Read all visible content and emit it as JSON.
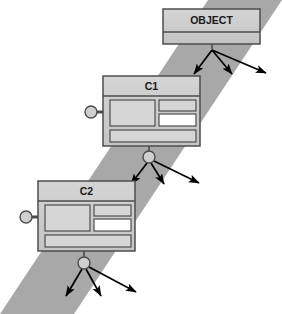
{
  "diagram": {
    "type": "class-hierarchy-diagram",
    "canvas": {
      "width": 282,
      "height": 314,
      "background": "#ffffff"
    },
    "colors": {
      "band": "#a8a8a8",
      "box_fill": "#cfcfcf",
      "box_header_fill": "#c8c8c8",
      "compartment_fill": "#d6d6d6",
      "compartment_highlight_fill": "#ffffff",
      "stroke": "#4d4d4d",
      "arrow": "#000000",
      "text": "#1a1a1a"
    },
    "band": {
      "name": "diagonal-band",
      "points": "208,0 282,0 74,314 0,314",
      "fill": "#a8a8a8"
    },
    "classes": [
      {
        "id": "object",
        "label": "OBJECT",
        "x": 163,
        "y": 9,
        "width": 97,
        "height": 35,
        "header_height": 23,
        "font_size": 10.5,
        "has_lollipop": false,
        "compartments": []
      },
      {
        "id": "c1",
        "label": "C1",
        "x": 103,
        "y": 76,
        "width": 97,
        "height": 70,
        "header_height": 20,
        "font_size": 10.5,
        "has_lollipop": true,
        "lollipop": {
          "cx": 91,
          "cy": 112,
          "r": 6,
          "line_to_x": 107
        },
        "compartments": [
          {
            "name": "left-large",
            "x": 110,
            "y": 100,
            "w": 45,
            "h": 26,
            "fill": "#d6d6d6"
          },
          {
            "name": "right-upper",
            "x": 159,
            "y": 100,
            "w": 37,
            "h": 11,
            "fill": "#d6d6d6"
          },
          {
            "name": "right-lower-highlight",
            "x": 159,
            "y": 114,
            "w": 37,
            "h": 12,
            "fill": "#ffffff"
          },
          {
            "name": "bottom-wide",
            "x": 110,
            "y": 130,
            "w": 86,
            "h": 12,
            "fill": "#d6d6d6"
          }
        ]
      },
      {
        "id": "c2",
        "label": "C2",
        "x": 38,
        "y": 181,
        "width": 97,
        "height": 70,
        "header_height": 20,
        "font_size": 10.5,
        "has_lollipop": true,
        "lollipop": {
          "cx": 26,
          "cy": 217,
          "r": 6,
          "line_to_x": 42
        },
        "compartments": [
          {
            "name": "left-large",
            "x": 45,
            "y": 205,
            "w": 45,
            "h": 26,
            "fill": "#d6d6d6"
          },
          {
            "name": "right-upper",
            "x": 94,
            "y": 205,
            "w": 37,
            "h": 11,
            "fill": "#d6d6d6"
          },
          {
            "name": "right-lower-highlight",
            "x": 94,
            "y": 219,
            "w": 37,
            "h": 12,
            "fill": "#ffffff"
          },
          {
            "name": "bottom-wide",
            "x": 45,
            "y": 235,
            "w": 86,
            "h": 12,
            "fill": "#d6d6d6"
          }
        ]
      }
    ],
    "junctions": [
      {
        "id": "junction-object",
        "from_class": "object",
        "stem": {
          "x1": 212,
          "y1": 44,
          "x2": 212,
          "y2": 49
        },
        "cx": 212,
        "cy": 49,
        "r": 0,
        "arrows": [
          {
            "x1": 212,
            "y1": 50,
            "x2": 194,
            "y2": 74
          },
          {
            "x1": 212,
            "y1": 50,
            "x2": 232,
            "y2": 74
          },
          {
            "x1": 212,
            "y1": 50,
            "x2": 266,
            "y2": 73
          }
        ]
      },
      {
        "id": "junction-c1",
        "from_class": "c1",
        "stem": {
          "x1": 149,
          "y1": 146,
          "x2": 149,
          "y2": 152
        },
        "cx": 149,
        "cy": 157,
        "r": 6,
        "arrows": [
          {
            "x1": 147,
            "y1": 163,
            "x2": 131,
            "y2": 184
          },
          {
            "x1": 151,
            "y1": 163,
            "x2": 164,
            "y2": 184
          },
          {
            "x1": 154,
            "y1": 161,
            "x2": 199,
            "y2": 183
          }
        ]
      },
      {
        "id": "junction-c2",
        "from_class": "c2",
        "stem": {
          "x1": 84,
          "y1": 251,
          "x2": 84,
          "y2": 258
        },
        "cx": 84,
        "cy": 263,
        "r": 6,
        "arrows": [
          {
            "x1": 82,
            "y1": 269,
            "x2": 66,
            "y2": 296
          },
          {
            "x1": 86,
            "y1": 269,
            "x2": 101,
            "y2": 296
          },
          {
            "x1": 89,
            "y1": 267,
            "x2": 136,
            "y2": 292
          }
        ]
      }
    ]
  }
}
